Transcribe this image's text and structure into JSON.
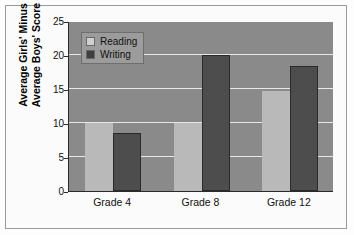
{
  "figure": {
    "frame": true,
    "background_color": "#fdfdfd"
  },
  "chart_data": {
    "type": "bar",
    "title": "",
    "subtitle": "",
    "xlabel": "",
    "ylabel": "Average Girls' Minus Average Boys' Score",
    "ylabel_line1": "Average Girls' Minus",
    "ylabel_line2": "Average Boys' Score",
    "categories": [
      "Grade 4",
      "Grade 8",
      "Grade 12"
    ],
    "series": [
      {
        "name": "Reading",
        "color": "#b9b9b9",
        "values": [
          10,
          10,
          14.7
        ]
      },
      {
        "name": "Writing",
        "color": "#4d4d4d",
        "values": [
          8.5,
          20,
          18.4
        ]
      }
    ],
    "ylim": [
      0,
      25
    ],
    "yticks": [
      0,
      5,
      10,
      15,
      20,
      25
    ],
    "ytick_labels": [
      "0",
      "5",
      "10",
      "15",
      "20",
      "25"
    ],
    "grid": true,
    "grid_color": "#e8e8e8",
    "plot_background": "#8a8a8a",
    "legend_position": "upper left",
    "legend_entries": [
      "Reading",
      "Writing"
    ]
  }
}
